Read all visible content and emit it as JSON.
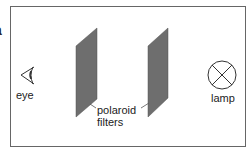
{
  "diagram": {
    "corner_fragment": "a",
    "labels": {
      "eye": "eye",
      "lamp": "lamp",
      "filters_line1": "polaroid",
      "filters_line2": "filters"
    },
    "colors": {
      "border": "#555555",
      "filter_fill": "#6e6e6e",
      "stroke": "#333333"
    }
  }
}
